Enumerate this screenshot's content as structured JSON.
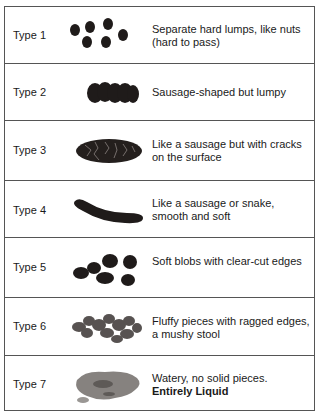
{
  "rows": [
    {
      "type": "Type 1",
      "description": "Separate hard lumps, like nuts (hard to pass)",
      "emphasis": "",
      "icon": "hard-lumps-icon"
    },
    {
      "type": "Type 2",
      "description": "Sausage-shaped but lumpy",
      "emphasis": "",
      "icon": "lumpy-sausage-icon"
    },
    {
      "type": "Type 3",
      "description": "Like a sausage but with cracks on the surface",
      "emphasis": "",
      "icon": "cracked-sausage-icon"
    },
    {
      "type": "Type 4",
      "description": "Like a sausage or snake, smooth and soft",
      "emphasis": "",
      "icon": "smooth-sausage-icon"
    },
    {
      "type": "Type 5",
      "description": "Soft blobs with clear-cut edges",
      "emphasis": "",
      "icon": "soft-blobs-icon"
    },
    {
      "type": "Type 6",
      "description": "Fluffy pieces with ragged edges, a mushy stool",
      "emphasis": "",
      "icon": "mushy-pieces-icon"
    },
    {
      "type": "Type 7",
      "description": "Watery, no solid pieces.",
      "emphasis": "Entirely Liquid",
      "icon": "liquid-icon"
    }
  ],
  "colors": {
    "stool": "#2a2422",
    "liquid": "#7d7a77",
    "border": "#555555"
  }
}
